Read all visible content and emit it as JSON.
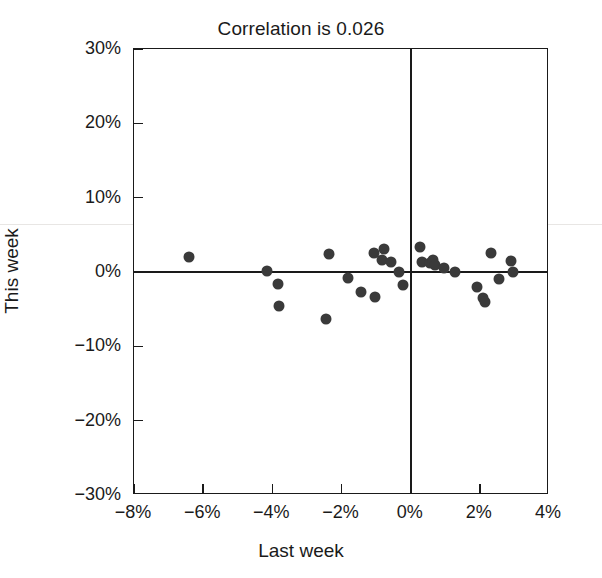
{
  "chart_data": {
    "type": "scatter",
    "title": "Correlation is 0.026",
    "xlabel": "Last week",
    "ylabel": "This week",
    "xlim": [
      -8,
      4
    ],
    "ylim": [
      -30,
      30
    ],
    "xticks": [
      -8,
      -6,
      -4,
      -2,
      0,
      2,
      4
    ],
    "xticklabels": [
      "-8%",
      "-6%",
      "-4%",
      "-2%",
      "0%",
      "2%",
      "4%"
    ],
    "yticks": [
      30,
      20,
      10,
      0,
      -10,
      -20,
      -30
    ],
    "yticklabels": [
      "30%",
      "20%",
      "10%",
      "0%",
      "-10%",
      "-20%",
      "-30%"
    ],
    "grid": false,
    "legend": null,
    "marker_color": "#3a3a3a",
    "reference_lines": {
      "x": 0,
      "y": 0,
      "color": "#1a1a1a"
    },
    "points": [
      {
        "x": -6.42,
        "y": 2.05
      },
      {
        "x": -4.14,
        "y": 0.15
      },
      {
        "x": -3.83,
        "y": -1.55
      },
      {
        "x": -3.8,
        "y": -4.55
      },
      {
        "x": -2.45,
        "y": -6.3
      },
      {
        "x": -2.36,
        "y": 2.4
      },
      {
        "x": -1.82,
        "y": -0.75
      },
      {
        "x": -1.43,
        "y": -2.7
      },
      {
        "x": -1.07,
        "y": 2.55
      },
      {
        "x": -1.02,
        "y": -3.3
      },
      {
        "x": -0.84,
        "y": 1.55
      },
      {
        "x": -0.78,
        "y": 3.05
      },
      {
        "x": -0.58,
        "y": 1.4
      },
      {
        "x": -0.33,
        "y": 0.05
      },
      {
        "x": -0.22,
        "y": -1.7
      },
      {
        "x": 0.26,
        "y": 3.35
      },
      {
        "x": 0.33,
        "y": 1.4
      },
      {
        "x": 0.57,
        "y": 1.25
      },
      {
        "x": 0.64,
        "y": 1.55
      },
      {
        "x": 0.7,
        "y": 0.9
      },
      {
        "x": 0.97,
        "y": 0.55
      },
      {
        "x": 1.28,
        "y": 0.05
      },
      {
        "x": 1.92,
        "y": -2.05
      },
      {
        "x": 2.08,
        "y": -3.45
      },
      {
        "x": 2.15,
        "y": -4.05
      },
      {
        "x": 2.32,
        "y": 2.55
      },
      {
        "x": 2.55,
        "y": -0.95
      },
      {
        "x": 2.9,
        "y": 1.45
      },
      {
        "x": 2.96,
        "y": 0.05
      }
    ]
  }
}
